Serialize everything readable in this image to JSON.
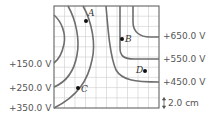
{
  "diagram": {
    "type": "equipotential-map",
    "grid": {
      "columns": 10,
      "rows": 10,
      "cell_size_label": "2.0 cm"
    },
    "left_labels": [
      {
        "text": "+150.0 V"
      },
      {
        "text": "+250.0 V"
      },
      {
        "text": "+350.0 V"
      }
    ],
    "right_labels": [
      {
        "text": "+650.0 V"
      },
      {
        "text": "+550.0 V"
      },
      {
        "text": "+450.0 V"
      }
    ],
    "points": [
      {
        "label": "A"
      },
      {
        "label": "B"
      },
      {
        "label": "C"
      },
      {
        "label": "D"
      }
    ],
    "scale_label": "2.0 cm",
    "colors": {
      "grid": "#c8c8c8",
      "border": "#555555",
      "curve": "#6e6e6e",
      "point": "#111111",
      "text": "#555555"
    }
  }
}
